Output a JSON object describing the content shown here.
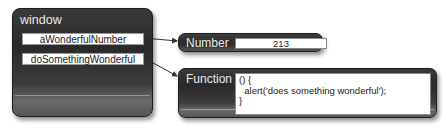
{
  "window": {
    "title": "window",
    "properties": [
      {
        "name": "aWonderfulNumber",
        "points_to": "number"
      },
      {
        "name": "doSomethingWonderful",
        "points_to": "function"
      }
    ]
  },
  "number": {
    "type_label": "Number",
    "value": "213"
  },
  "function": {
    "type_label": "Function",
    "code": {
      "line1": "() {",
      "line2": "  alert('does something wonderful');",
      "line3": "}"
    }
  },
  "colors": {
    "panel_dark": "#2a2a2a",
    "panel_highlight": "#6a6a6a",
    "label_text": "#e8e8e8",
    "field_bg": "#ffffff",
    "arrow": "#333333"
  }
}
